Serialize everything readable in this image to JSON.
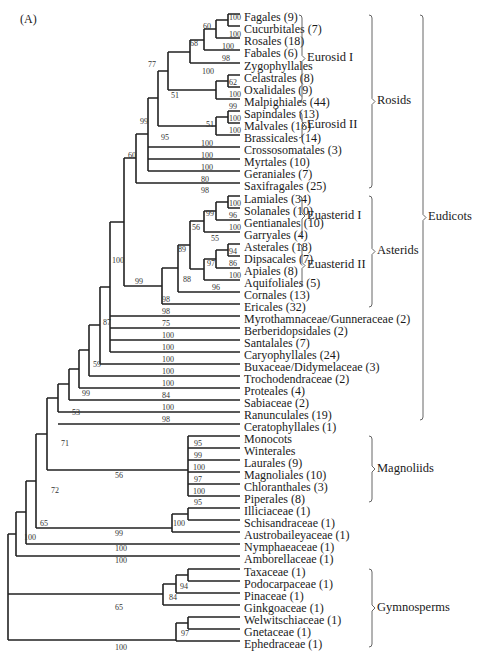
{
  "figure": {
    "panel_label": "(A)",
    "leaves": [
      {
        "name": "Fagales (9)",
        "y": 18
      },
      {
        "name": "Cucurbitales (7)",
        "y": 30
      },
      {
        "name": "Rosales (18)",
        "y": 42
      },
      {
        "name": "Fabales (6)",
        "y": 54
      },
      {
        "name": "Zygophyllales",
        "y": 67
      },
      {
        "name": "Celastrales (8)",
        "y": 79
      },
      {
        "name": "Oxalidales (9)",
        "y": 91
      },
      {
        "name": "Malpighiales (44)",
        "y": 103
      },
      {
        "name": "Sapindales (13)",
        "y": 115
      },
      {
        "name": "Malvales (16)",
        "y": 127
      },
      {
        "name": "Brassicales (14)",
        "y": 139
      },
      {
        "name": "Crossosomatales (3)",
        "y": 151
      },
      {
        "name": "Myrtales (10)",
        "y": 163
      },
      {
        "name": "Geraniales (7)",
        "y": 175
      },
      {
        "name": "Saxifragales (25)",
        "y": 187
      },
      {
        "name": "Lamiales (34)",
        "y": 200
      },
      {
        "name": "Solanales (10)",
        "y": 212
      },
      {
        "name": "Gentianales (10)",
        "y": 224
      },
      {
        "name": "Garryales (4)",
        "y": 236
      },
      {
        "name": "Asterales (18)",
        "y": 248
      },
      {
        "name": "Dipsacales (7)",
        "y": 260
      },
      {
        "name": "Apiales (8)",
        "y": 272
      },
      {
        "name": "Aquifoliales (5)",
        "y": 284
      },
      {
        "name": "Cornales (13)",
        "y": 296
      },
      {
        "name": "Ericales (32)",
        "y": 308
      },
      {
        "name": "Myrothamnaceae/Gunneraceae (2)",
        "y": 320
      },
      {
        "name": "Berberidopsidales (2)",
        "y": 332
      },
      {
        "name": "Santalales (7)",
        "y": 344
      },
      {
        "name": "Caryophyllales (24)",
        "y": 356
      },
      {
        "name": "Buxaceae/Didymelaceae (3)",
        "y": 368
      },
      {
        "name": "Trochodendraceae (2)",
        "y": 380
      },
      {
        "name": "Proteales (4)",
        "y": 392
      },
      {
        "name": "Sabiaceae (2)",
        "y": 404
      },
      {
        "name": "Ranunculales (19)",
        "y": 416
      },
      {
        "name": "Ceratophyllales (1)",
        "y": 428
      },
      {
        "name": "Monocots",
        "y": 440
      },
      {
        "name": "Winterales",
        "y": 452
      },
      {
        "name": "Laurales (9)",
        "y": 464
      },
      {
        "name": "Magnoliales (10)",
        "y": 476
      },
      {
        "name": "Chloranthales (3)",
        "y": 488
      },
      {
        "name": "Piperales (8)",
        "y": 500
      },
      {
        "name": "Illiciaceae (1)",
        "y": 512
      },
      {
        "name": "Schisandraceae (1)",
        "y": 524
      },
      {
        "name": "Austrobaileyaceae (1)",
        "y": 536
      },
      {
        "name": "Nymphaeaceae (1)",
        "y": 548
      },
      {
        "name": "Amborellaceae (1)",
        "y": 560
      },
      {
        "name": "Taxaceae (1)",
        "y": 573
      },
      {
        "name": "Podocarpaceae (1)",
        "y": 585
      },
      {
        "name": "Pinaceae (1)",
        "y": 597
      },
      {
        "name": "Ginkgoaceae (1)",
        "y": 609
      },
      {
        "name": "Welwitschiaceae (1)",
        "y": 621
      },
      {
        "name": "Gnetaceae (1)",
        "y": 633
      },
      {
        "name": "Ephedraceae (1)",
        "y": 645
      }
    ],
    "support_values": [
      {
        "v": "100",
        "x": 229,
        "y": 20
      },
      {
        "v": "60",
        "x": 203,
        "y": 29
      },
      {
        "v": "100",
        "x": 229,
        "y": 37
      },
      {
        "v": "100",
        "x": 222,
        "y": 49
      },
      {
        "v": "68",
        "x": 190,
        "y": 46
      },
      {
        "v": "98",
        "x": 222,
        "y": 61
      },
      {
        "v": "77",
        "x": 148,
        "y": 67
      },
      {
        "v": "100",
        "x": 202,
        "y": 74
      },
      {
        "v": "62",
        "x": 229,
        "y": 85
      },
      {
        "v": "100",
        "x": 229,
        "y": 97
      },
      {
        "v": "51",
        "x": 171,
        "y": 98
      },
      {
        "v": "99",
        "x": 229,
        "y": 109
      },
      {
        "v": "100",
        "x": 229,
        "y": 121
      },
      {
        "v": "51",
        "x": 206,
        "y": 127
      },
      {
        "v": "100",
        "x": 229,
        "y": 133
      },
      {
        "v": "95",
        "x": 161,
        "y": 140
      },
      {
        "v": "99",
        "x": 140,
        "y": 124
      },
      {
        "v": "100",
        "x": 201,
        "y": 146
      },
      {
        "v": "100",
        "x": 201,
        "y": 158
      },
      {
        "v": "100",
        "x": 201,
        "y": 170
      },
      {
        "v": "80",
        "x": 201,
        "y": 182
      },
      {
        "v": "60",
        "x": 128,
        "y": 158
      },
      {
        "v": "98",
        "x": 201,
        "y": 193
      },
      {
        "v": "100",
        "x": 229,
        "y": 206
      },
      {
        "v": "99",
        "x": 206,
        "y": 216
      },
      {
        "v": "96",
        "x": 229,
        "y": 218
      },
      {
        "v": "100",
        "x": 229,
        "y": 230
      },
      {
        "v": "56",
        "x": 192,
        "y": 230
      },
      {
        "v": "55",
        "x": 211,
        "y": 241
      },
      {
        "v": "94",
        "x": 229,
        "y": 254
      },
      {
        "v": "89",
        "x": 178,
        "y": 252
      },
      {
        "v": "97",
        "x": 207,
        "y": 266
      },
      {
        "v": "86",
        "x": 229,
        "y": 266
      },
      {
        "v": "100",
        "x": 229,
        "y": 278
      },
      {
        "v": "88",
        "x": 183,
        "y": 282
      },
      {
        "v": "96",
        "x": 212,
        "y": 290
      },
      {
        "v": "100",
        "x": 112,
        "y": 263
      },
      {
        "v": "99",
        "x": 135,
        "y": 284
      },
      {
        "v": "98",
        "x": 162,
        "y": 302
      },
      {
        "v": "98",
        "x": 162,
        "y": 314
      },
      {
        "v": "87",
        "x": 103,
        "y": 325
      },
      {
        "v": "75",
        "x": 162,
        "y": 326
      },
      {
        "v": "100",
        "x": 162,
        "y": 338
      },
      {
        "v": "100",
        "x": 162,
        "y": 350
      },
      {
        "v": "100",
        "x": 162,
        "y": 362
      },
      {
        "v": "59",
        "x": 93,
        "y": 367
      },
      {
        "v": "100",
        "x": 162,
        "y": 374
      },
      {
        "v": "100",
        "x": 162,
        "y": 386
      },
      {
        "v": "99",
        "x": 82,
        "y": 396
      },
      {
        "v": "84",
        "x": 162,
        "y": 398
      },
      {
        "v": "53",
        "x": 72,
        "y": 415
      },
      {
        "v": "100",
        "x": 162,
        "y": 410
      },
      {
        "v": "98",
        "x": 162,
        "y": 422
      },
      {
        "v": "95",
        "x": 194,
        "y": 446
      },
      {
        "v": "71",
        "x": 61,
        "y": 446
      },
      {
        "v": "99",
        "x": 194,
        "y": 458
      },
      {
        "v": "100",
        "x": 193,
        "y": 470
      },
      {
        "v": "56",
        "x": 115,
        "y": 478
      },
      {
        "v": "97",
        "x": 194,
        "y": 482
      },
      {
        "v": "100",
        "x": 193,
        "y": 494
      },
      {
        "v": "95",
        "x": 194,
        "y": 505
      },
      {
        "v": "72",
        "x": 51,
        "y": 493
      },
      {
        "v": "100",
        "x": 173,
        "y": 526
      },
      {
        "v": "99",
        "x": 115,
        "y": 536
      },
      {
        "v": "65",
        "x": 40,
        "y": 526
      },
      {
        "v": "100",
        "x": 115,
        "y": 551
      },
      {
        "v": "100",
        "x": 24,
        "y": 540
      },
      {
        "v": "100",
        "x": 115,
        "y": 563
      },
      {
        "v": "94",
        "x": 180,
        "y": 589
      },
      {
        "v": "84",
        "x": 169,
        "y": 600
      },
      {
        "v": "65",
        "x": 115,
        "y": 610
      },
      {
        "v": "97",
        "x": 181,
        "y": 636
      },
      {
        "v": "100",
        "x": 115,
        "y": 650
      }
    ],
    "clades": [
      {
        "label": "Eurosid I",
        "top": 15,
        "bottom": 102,
        "x": 302,
        "level": 1
      },
      {
        "label": "Eurosid II",
        "top": 112,
        "bottom": 138,
        "x": 302,
        "level": 1
      },
      {
        "label": "Euasterid I",
        "top": 196,
        "bottom": 236,
        "x": 302,
        "level": 1
      },
      {
        "label": "Euasterid II",
        "top": 244,
        "bottom": 287,
        "x": 302,
        "level": 1
      },
      {
        "label": "Rosids",
        "top": 15,
        "bottom": 188,
        "x": 372,
        "level": 2
      },
      {
        "label": "Asterids",
        "top": 196,
        "bottom": 307,
        "x": 372,
        "level": 2
      },
      {
        "label": "Eudicots",
        "top": 15,
        "bottom": 420,
        "x": 423,
        "level": 3
      },
      {
        "label": "Magnoliids",
        "top": 436,
        "bottom": 502,
        "x": 372,
        "level": 2
      },
      {
        "label": "Gymnosperms",
        "top": 569,
        "bottom": 647,
        "x": 372,
        "level": 2
      }
    ]
  }
}
